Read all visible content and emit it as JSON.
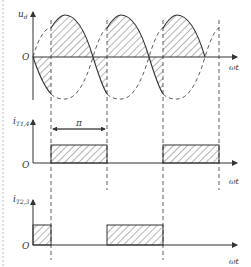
{
  "diagram": {
    "colors": {
      "stroke": "#333333",
      "hatch": "#444444",
      "border_dash": "#bbbbbb",
      "background": "#ffffff"
    },
    "plots": [
      {
        "id": "ud",
        "y_label": "u",
        "y_label_sub": "d",
        "x_label": "ωt",
        "origin_label": "O",
        "waveform": "sinusoid with dashed inverted companion; hatched output between firing points"
      },
      {
        "id": "iT14",
        "y_label": "i",
        "y_label_sub": "T1,4",
        "x_label": "ωt",
        "origin_label": "O",
        "pulse_width_label": "π",
        "waveform": "rectangular current pulses, hatched"
      },
      {
        "id": "iT23",
        "y_label": "i",
        "y_label_sub": "T2,3",
        "x_label": "ωt",
        "origin_label": "O",
        "waveform": "rectangular current pulses offset by π, hatched"
      }
    ]
  }
}
